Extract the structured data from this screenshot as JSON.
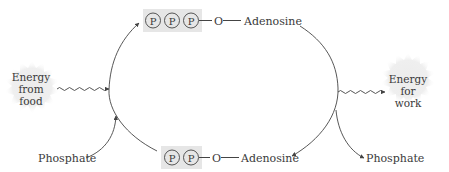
{
  "diagram": {
    "type": "ATP-ADP cycle",
    "top_molecule": {
      "phosphates": [
        "P",
        "P",
        "P"
      ],
      "oxygen": "O",
      "base": "Adenosine"
    },
    "bottom_molecule": {
      "phosphates": [
        "P",
        "P"
      ],
      "oxygen": "O",
      "base": "Adenosine"
    },
    "energy_in": {
      "line1": "Energy",
      "line2": "from",
      "line3": "food"
    },
    "energy_out": {
      "line1": "Energy",
      "line2": "for",
      "line3": "work"
    },
    "phosphate_in": "Phosphate",
    "phosphate_out": "Phosphate",
    "colors": {
      "phosphate_box": "#e6e6e6",
      "burst": "#eeeeee",
      "line": "#444444"
    }
  }
}
